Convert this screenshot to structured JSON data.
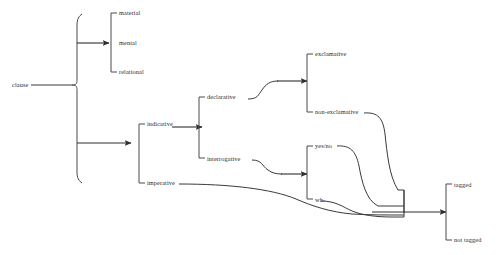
{
  "diagram": {
    "root": {
      "label": "clause"
    },
    "systems": [
      {
        "name": "process-type",
        "terms": [
          {
            "label": "material"
          },
          {
            "label": "mental"
          },
          {
            "label": "relational"
          }
        ]
      },
      {
        "name": "mood-type",
        "terms": [
          {
            "label": "indicative"
          },
          {
            "label": "imperative"
          }
        ]
      },
      {
        "name": "indicative-type",
        "terms": [
          {
            "label": "declarative"
          },
          {
            "label": "interrogative"
          }
        ]
      },
      {
        "name": "declarative-type",
        "terms": [
          {
            "label": "exclamative"
          },
          {
            "label": "non-exclamative"
          }
        ]
      },
      {
        "name": "interrogative-type",
        "terms": [
          {
            "label": "yes/no"
          },
          {
            "label": "wh-"
          }
        ]
      },
      {
        "name": "tagging",
        "terms": [
          {
            "label": "tagged"
          },
          {
            "label": "not tagged"
          }
        ]
      }
    ],
    "colors": {
      "line": "#3a3a3a",
      "text": "#2b2b2b",
      "background": "#ffffff"
    }
  }
}
